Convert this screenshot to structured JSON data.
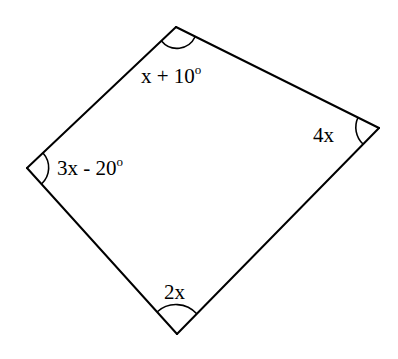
{
  "diagram": {
    "type": "quadrilateral",
    "vertices": {
      "top": {
        "x": 176,
        "y": 27
      },
      "right": {
        "x": 379,
        "y": 128
      },
      "bottom": {
        "x": 177,
        "y": 334
      },
      "left": {
        "x": 27,
        "y": 168
      }
    },
    "angles": {
      "top": {
        "label": "x + 10",
        "degree_mark": "o"
      },
      "right": {
        "label": "4x",
        "degree_mark": ""
      },
      "bottom": {
        "label": "2x",
        "degree_mark": ""
      },
      "left": {
        "label": "3x - 20",
        "degree_mark": "o"
      }
    },
    "colors": {
      "stroke": "#000000",
      "background": "#ffffff"
    }
  }
}
